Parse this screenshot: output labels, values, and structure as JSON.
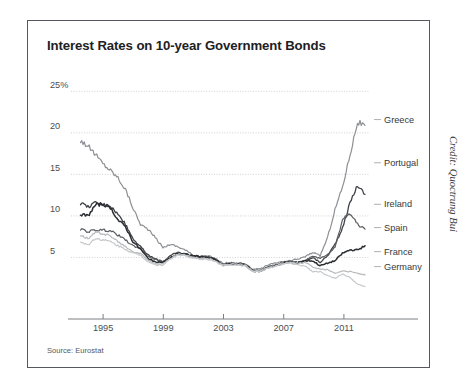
{
  "figure": {
    "title": "Interest Rates on 10-year Government Bonds",
    "source_note": "Source: Eurostat",
    "credit": "Credit: Quoctrung Bui",
    "border_color": "#55585c",
    "background": "#ffffff"
  },
  "chart_data": {
    "type": "line",
    "title": "Interest Rates on 10-year Government Bonds",
    "xlabel": "",
    "ylabel": "",
    "ylim": [
      0,
      26
    ],
    "xlim": [
      1993.0,
      2012.6
    ],
    "grid": true,
    "grid_axis": "y",
    "legend_position": "right-inline-labels",
    "ytick_labels": [
      "5",
      "10",
      "15",
      "20",
      "25%"
    ],
    "ytick_values": [
      5,
      10,
      15,
      20,
      25
    ],
    "xtick_labels": [
      "1995",
      "1999",
      "2003",
      "2007",
      "2011"
    ],
    "xtick_values": [
      1995,
      1999,
      2003,
      2007,
      2011
    ],
    "x": [
      1993.5,
      1994.0,
      1994.5,
      1995.0,
      1995.5,
      1996.0,
      1996.5,
      1997.0,
      1997.5,
      1998.0,
      1998.5,
      1999.0,
      1999.5,
      2000.0,
      2000.5,
      2001.0,
      2001.5,
      2002.0,
      2002.5,
      2003.0,
      2003.5,
      2004.0,
      2004.5,
      2005.0,
      2005.5,
      2006.0,
      2006.5,
      2007.0,
      2007.5,
      2008.0,
      2008.5,
      2009.0,
      2009.5,
      2010.0,
      2010.5,
      2011.0,
      2011.5,
      2012.0,
      2012.4
    ],
    "series": [
      {
        "name": "Greece",
        "color": "#8d9094",
        "width": 1.2,
        "label_y": 21.6,
        "values": [
          19.1,
          18.4,
          17.4,
          16.3,
          15.5,
          14.6,
          13.2,
          11.0,
          9.0,
          8.4,
          7.4,
          6.2,
          6.6,
          6.3,
          5.9,
          5.3,
          5.1,
          5.2,
          4.9,
          4.3,
          4.4,
          4.3,
          4.2,
          3.6,
          3.6,
          4.1,
          4.3,
          4.5,
          4.6,
          4.8,
          5.1,
          5.6,
          5.2,
          7.4,
          10.8,
          13.5,
          17.4,
          21.3,
          20.9
        ]
      },
      {
        "name": "Portugal",
        "color": "#3f4246",
        "width": 1.3,
        "label_y": 16.4,
        "values": [
          11.5,
          11.1,
          11.6,
          11.4,
          11.2,
          10.2,
          9.0,
          7.3,
          6.3,
          5.3,
          4.8,
          4.5,
          5.2,
          5.6,
          5.4,
          5.2,
          5.1,
          5.1,
          4.7,
          4.2,
          4.3,
          4.3,
          4.2,
          3.4,
          3.4,
          3.9,
          4.1,
          4.4,
          4.5,
          4.4,
          4.6,
          5.0,
          4.4,
          5.2,
          6.6,
          8.5,
          11.6,
          13.7,
          12.6
        ]
      },
      {
        "name": "Ireland",
        "color": "#5a5d61",
        "width": 1.2,
        "label_y": 11.4,
        "values": [
          8.4,
          8.1,
          8.3,
          8.3,
          8.2,
          7.7,
          7.1,
          6.4,
          6.1,
          5.1,
          4.8,
          4.5,
          5.0,
          5.5,
          5.3,
          5.0,
          5.0,
          5.0,
          4.7,
          4.1,
          4.2,
          4.2,
          4.1,
          3.3,
          3.3,
          3.8,
          4.0,
          4.3,
          4.4,
          4.4,
          4.6,
          5.2,
          4.9,
          5.4,
          6.2,
          9.6,
          10.3,
          9.0,
          8.4
        ]
      },
      {
        "name": "Spain",
        "color": "#2b2e32",
        "width": 1.5,
        "label_y": 8.6,
        "values": [
          10.2,
          10.0,
          11.3,
          11.4,
          11.0,
          9.5,
          8.7,
          6.9,
          6.0,
          4.9,
          4.5,
          4.4,
          4.9,
          5.5,
          5.4,
          5.2,
          5.1,
          5.0,
          4.8,
          4.1,
          4.2,
          4.2,
          4.1,
          3.4,
          3.4,
          3.8,
          4.0,
          4.3,
          4.4,
          4.4,
          4.6,
          4.6,
          4.0,
          4.3,
          4.6,
          5.5,
          5.9,
          5.9,
          6.4
        ]
      },
      {
        "name": "France",
        "color": "#b7babd",
        "width": 1.2,
        "label_y": 5.7,
        "values": [
          7.7,
          7.3,
          8.0,
          7.9,
          7.6,
          6.9,
          6.3,
          5.7,
          5.5,
          4.7,
          4.3,
          4.2,
          4.9,
          5.4,
          5.3,
          5.0,
          4.9,
          4.9,
          4.6,
          4.1,
          4.2,
          4.2,
          4.1,
          3.4,
          3.4,
          3.8,
          4.0,
          4.3,
          4.4,
          4.3,
          4.4,
          3.9,
          3.6,
          3.5,
          3.1,
          3.4,
          3.3,
          3.1,
          2.9
        ]
      },
      {
        "name": "Germany",
        "color": "#c6c9cc",
        "width": 1.2,
        "label_y": 3.9,
        "values": [
          6.9,
          6.5,
          7.3,
          7.1,
          6.9,
          6.4,
          6.0,
          5.5,
          5.3,
          4.5,
          4.1,
          4.1,
          4.8,
          5.3,
          5.2,
          4.9,
          4.8,
          4.8,
          4.5,
          4.0,
          4.1,
          4.1,
          4.0,
          3.3,
          3.3,
          3.7,
          3.9,
          4.2,
          4.3,
          4.1,
          4.0,
          3.3,
          3.3,
          2.8,
          2.5,
          3.0,
          2.6,
          1.8,
          1.5
        ]
      }
    ]
  }
}
